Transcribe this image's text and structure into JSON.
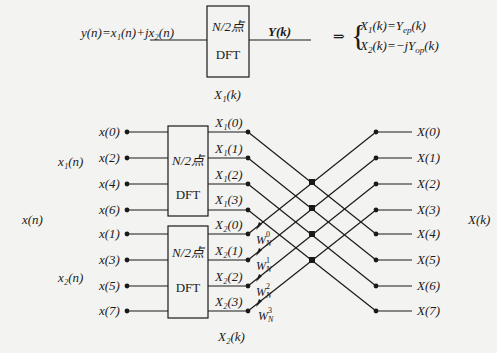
{
  "top_section": {
    "equation_lhs": "y(n)=x₁(n)+jx₂(n)",
    "dft_box": {
      "line1": "N/2点",
      "line2": "DFT"
    },
    "output_label": "Y(k)",
    "below_box_label": "X₁(k)",
    "implies": "⇒",
    "result_lines": [
      "X₁(k)=Yep(k)",
      "X₂(k)=−jYop(k)"
    ],
    "result_parts": [
      {
        "lhs": "X",
        "lhs_sub": "1",
        "arg": "(k)=",
        "rhs_pre": "",
        "rhs": "Y",
        "rhs_sub": "ep",
        "rhs_arg": "(k)"
      },
      {
        "lhs": "X",
        "lhs_sub": "2",
        "arg": "(k)=",
        "rhs_pre": "−j",
        "rhs": "Y",
        "rhs_sub": "op",
        "rhs_arg": "(k)"
      }
    ]
  },
  "butterfly": {
    "input_group_label": "x(n)",
    "subgroup_labels": [
      "x₁(n)",
      "x₂(n)"
    ],
    "inputs": [
      "x(0)",
      "x(2)",
      "x(4)",
      "x(6)",
      "x(1)",
      "x(3)",
      "x(5)",
      "x(7)"
    ],
    "dft_boxes": [
      {
        "line1": "N/2点",
        "line2": "DFT"
      },
      {
        "line1": "N/2点",
        "line2": "DFT"
      }
    ],
    "intermediate_outputs": [
      "X₁(0)",
      "X₁(1)",
      "X₁(2)",
      "X₁(3)",
      "X₂(0)",
      "X₂(1)",
      "X₂(2)",
      "X₂(3)"
    ],
    "twiddles": [
      {
        "base": "W",
        "sub": "N",
        "sup": "0"
      },
      {
        "base": "W",
        "sub": "N",
        "sup": "1"
      },
      {
        "base": "W",
        "sub": "N",
        "sup": "2"
      },
      {
        "base": "W",
        "sub": "N",
        "sup": "3"
      }
    ],
    "outputs": [
      "X(0)",
      "X(1)",
      "X(2)",
      "X(3)",
      "X(4)",
      "X(5)",
      "X(6)",
      "X(7)"
    ],
    "output_group_label": "X(k)",
    "bottom_label": "X₂(k)"
  },
  "colors": {
    "ink": "#1a1a1a",
    "paper": "#f3f3f1"
  }
}
